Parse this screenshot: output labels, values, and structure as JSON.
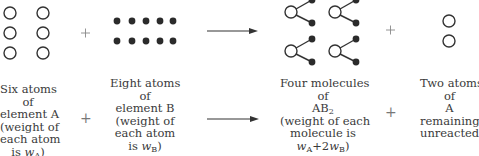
{
  "top_row": {
    "element_A_atoms": 6,
    "element_B_atoms": 10,
    "molecules_AB2": 4,
    "remaining_A_atoms": 2,
    "plus_1": "+",
    "plus_2": "+"
  },
  "labels": {
    "reactant_A": [
      "Six atoms",
      "of",
      "element A",
      "(weight of",
      "each atom",
      "is w_A)"
    ],
    "reactant_B": [
      "Eight atoms",
      "of",
      "element B",
      "(weight of",
      "each atom",
      "is w_B)"
    ],
    "product_AB2": [
      "Four molecules",
      "of",
      "AB2",
      "(weight of each",
      "molecule is",
      "w_A+2w_B)"
    ],
    "leftover_A": [
      "Two atoms",
      "of",
      "A",
      "remaining",
      "unreacted"
    ],
    "plus": "+"
  },
  "colors": {
    "stroke": "#333333",
    "filled_atom": "#2b2b2b",
    "plus": "#777777"
  }
}
